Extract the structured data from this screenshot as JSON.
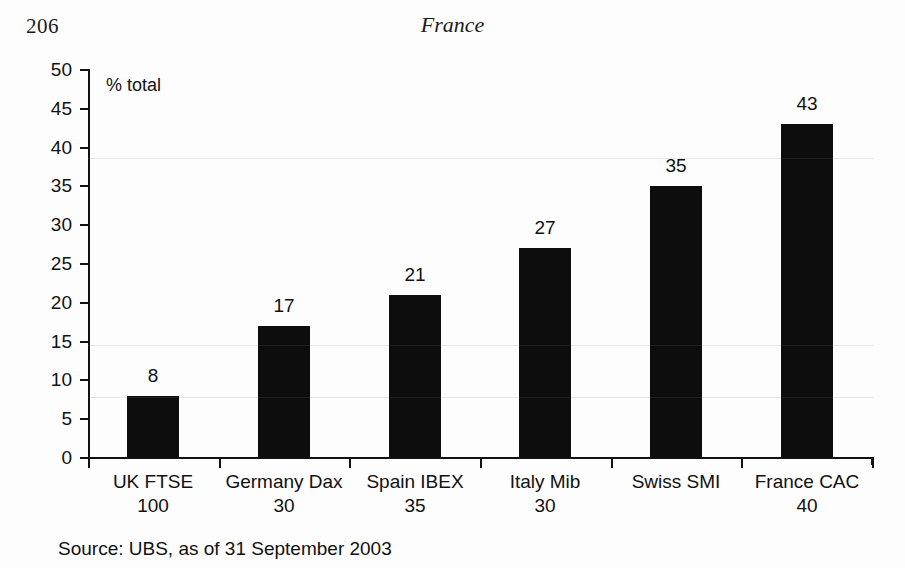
{
  "page": {
    "number": "206",
    "running_head": "France"
  },
  "chart_data": {
    "type": "bar",
    "title": "",
    "xlabel": "",
    "ylabel": "% total",
    "ylim": [
      0,
      50
    ],
    "ytick_step": 5,
    "grid": false,
    "legend": "none",
    "orientation": "vertical",
    "bar_color": "#0d0d0d",
    "categories": [
      "UK FTSE 100",
      "Germany Dax 30",
      "Spain IBEX 35",
      "Italy Mib 30",
      "Swiss SMI",
      "France CAC 40"
    ],
    "category_lines": [
      {
        "line1": "UK FTSE",
        "line2": "100"
      },
      {
        "line1": "Germany Dax",
        "line2": "30"
      },
      {
        "line1": "Spain IBEX",
        "line2": "35"
      },
      {
        "line1": "Italy Mib",
        "line2": "30"
      },
      {
        "line1": "Swiss SMI",
        "line2": ""
      },
      {
        "line1": "France CAC",
        "line2": "40"
      }
    ],
    "values": [
      8,
      17,
      21,
      27,
      35,
      43
    ],
    "value_labels": [
      "8",
      "17",
      "21",
      "27",
      "35",
      "43"
    ],
    "yticks": [
      0,
      5,
      10,
      15,
      20,
      25,
      30,
      35,
      40,
      45,
      50
    ],
    "ytick_labels": [
      "0",
      "5",
      "10",
      "15",
      "20",
      "25",
      "30",
      "35",
      "40",
      "45",
      "50"
    ],
    "annotations": [
      "% total"
    ]
  },
  "source": {
    "text": "Source: UBS, as of 31 September 2003"
  }
}
